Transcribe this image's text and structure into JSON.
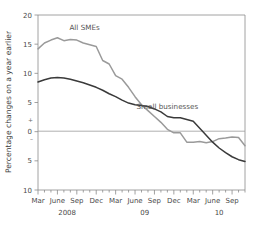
{
  "chart_data": {
    "type": "line",
    "title": "",
    "xlabel": "",
    "ylabel": "Percentage changes on a year earlier",
    "ylim": [
      -10,
      20
    ],
    "yticks": [
      20,
      15,
      10,
      5,
      0,
      -5,
      -10
    ],
    "ytick_labels": [
      "20",
      "15",
      "10",
      "5",
      "0",
      "5",
      "10"
    ],
    "y_sign_plus": "+",
    "y_sign_minus": "–",
    "grid": false,
    "zero_line": true,
    "legend_position": "inline-annotation",
    "x": [
      "Mar 2008",
      "Apr 2008",
      "May 2008",
      "Jun 2008",
      "Jul 2008",
      "Aug 2008",
      "Sep 2008",
      "Oct 2008",
      "Nov 2008",
      "Dec 2008",
      "Jan 2009",
      "Feb 2009",
      "Mar 2009",
      "Apr 2009",
      "May 2009",
      "Jun 2009",
      "Jul 2009",
      "Aug 2009",
      "Sep 2009",
      "Oct 2009",
      "Nov 2009",
      "Dec 2009",
      "Jan 2010",
      "Feb 2010",
      "Mar 2010",
      "Apr 2010",
      "May 2010",
      "Jun 2010",
      "Jul 2010",
      "Aug 2010",
      "Sep 2010",
      "Oct 2010",
      "Nov 2010"
    ],
    "xtick_labels": [
      "Mar",
      "June",
      "Sep",
      "Dec",
      "Mar",
      "June",
      "Sep",
      "Dec",
      "Mar",
      "June",
      "Sep"
    ],
    "xtick_positions": [
      0,
      3,
      6,
      9,
      12,
      15,
      18,
      21,
      24,
      27,
      30
    ],
    "year_labels": [
      {
        "text": "2008",
        "at_index": 4.5
      },
      {
        "text": "09",
        "at_index": 16.5
      },
      {
        "text": "10",
        "at_index": 28.0
      }
    ],
    "series": [
      {
        "name": "All SMEs",
        "color": "#9a9a9a",
        "label_x_index": 7.2,
        "label_y_value": 17.4,
        "values": [
          14.2,
          15.2,
          15.7,
          16.1,
          15.6,
          15.8,
          15.7,
          15.2,
          14.9,
          14.6,
          12.2,
          11.6,
          9.6,
          9.0,
          7.6,
          6.0,
          4.6,
          3.6,
          2.6,
          1.6,
          0.4,
          -0.2,
          -0.2,
          -1.8,
          -1.8,
          -1.7,
          -1.9,
          -1.7,
          -1.2,
          -1.1,
          -0.9,
          -1.0,
          -2.4
        ]
      },
      {
        "name": "Small businesses",
        "color": "#3a3a3a",
        "label_x_index": 20.0,
        "label_y_value": 3.9,
        "values": [
          8.5,
          8.9,
          9.2,
          9.3,
          9.2,
          9.0,
          8.7,
          8.4,
          8.0,
          7.6,
          7.1,
          6.5,
          6.0,
          5.4,
          4.9,
          4.6,
          4.5,
          4.3,
          3.9,
          3.4,
          2.6,
          2.4,
          2.4,
          2.1,
          1.8,
          0.6,
          -0.6,
          -1.8,
          -2.8,
          -3.6,
          -4.3,
          -4.8,
          -5.1
        ]
      }
    ]
  }
}
